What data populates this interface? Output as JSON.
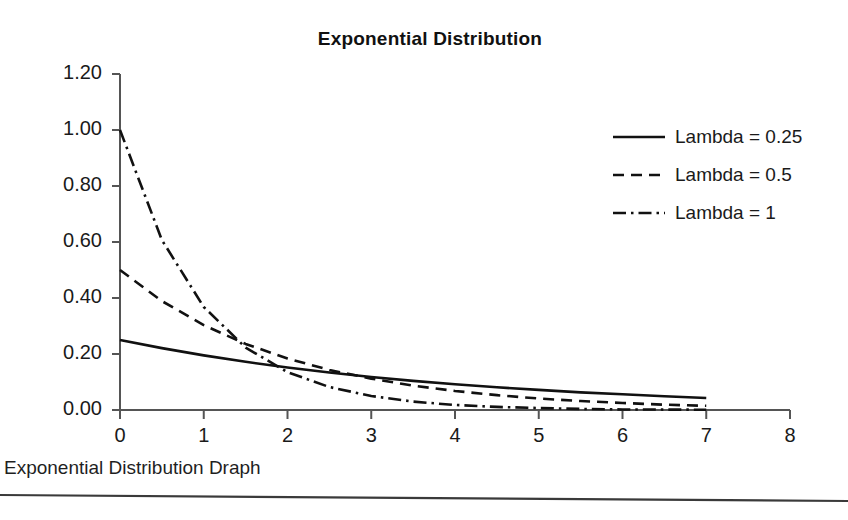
{
  "document": {
    "caption": "Exponential Distribution Draph",
    "background_color": "#ffffff",
    "ink_color": "#1a1a1a"
  },
  "chart_data": {
    "type": "line",
    "title": "Exponential Distribution",
    "xlabel": "",
    "ylabel": "",
    "xlim": [
      0,
      8
    ],
    "ylim": [
      0,
      1.2
    ],
    "xticks": [
      "0",
      "1",
      "2",
      "3",
      "4",
      "5",
      "6",
      "7",
      "8"
    ],
    "yticks": [
      "0.00",
      "0.20",
      "0.40",
      "0.60",
      "0.80",
      "1.00",
      "1.20"
    ],
    "grid": false,
    "legend_position": "right",
    "x": [
      0,
      0.5,
      1,
      1.5,
      2,
      2.5,
      3,
      3.5,
      4,
      4.5,
      5,
      5.5,
      6,
      6.5,
      7
    ],
    "series": [
      {
        "name": "Lambda = 0.25",
        "lambda": 0.25,
        "style": "solid",
        "color": "#111111",
        "values": [
          0.25,
          0.221,
          0.195,
          0.172,
          0.152,
          0.134,
          0.118,
          0.104,
          0.092,
          0.081,
          0.072,
          0.063,
          0.056,
          0.049,
          0.043
        ]
      },
      {
        "name": "Lambda = 0.5",
        "lambda": 0.5,
        "style": "dashed",
        "color": "#111111",
        "values": [
          0.5,
          0.389,
          0.303,
          0.236,
          0.184,
          0.143,
          0.112,
          0.087,
          0.068,
          0.053,
          0.041,
          0.032,
          0.025,
          0.019,
          0.015
        ]
      },
      {
        "name": "Lambda = 1",
        "lambda": 1,
        "style": "dashdot",
        "color": "#111111",
        "values": [
          1.0,
          0.607,
          0.368,
          0.223,
          0.135,
          0.082,
          0.05,
          0.03,
          0.018,
          0.011,
          0.007,
          0.004,
          0.002,
          0.0015,
          0.001
        ]
      }
    ]
  },
  "legend": {
    "items": [
      {
        "label": "Lambda = 0.25",
        "style": "solid"
      },
      {
        "label": "Lambda = 0.5",
        "style": "dashed"
      },
      {
        "label": "Lambda = 1",
        "style": "dashdot"
      }
    ]
  }
}
